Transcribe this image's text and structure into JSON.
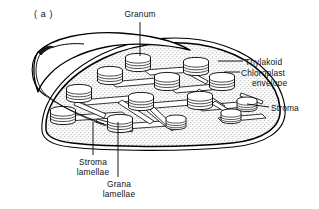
{
  "figure": {
    "panel_letter": "( a )",
    "background_color": "#ffffff",
    "ink_color": "#000000",
    "stroma_fill": "#d9d9d9"
  },
  "labels": {
    "granum": "Granum",
    "thylakoid": "Thylakoid",
    "chloroplast_envelope_line1": "Chloroplast",
    "chloroplast_envelope_line2": "envelope",
    "stroma": "Stroma",
    "stroma_lamellae_line1": "Stroma",
    "stroma_lamellae_line2": "lamellae",
    "grana_lamellae_line1": "Grana",
    "grana_lamellae_line2": "lamellae"
  },
  "structures": {
    "envelope": "chloroplast-envelope-outline",
    "envelope_flap": "peeled-back-envelope-flap",
    "stroma_region": "stippled-stroma-matrix",
    "grana_stacks_count": 13,
    "lamellae_bands": "interconnecting-stroma-lamellae-sheets"
  }
}
